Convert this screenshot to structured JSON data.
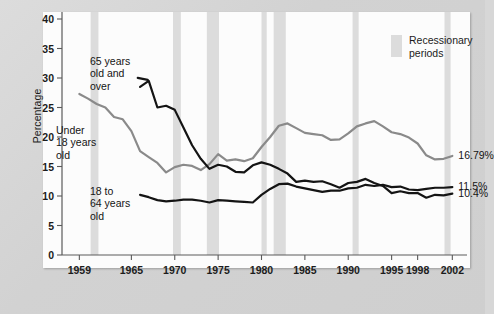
{
  "chart_data": {
    "type": "line",
    "title": "",
    "xlabel": "",
    "ylabel": "Percentage",
    "ylim": [
      0,
      40
    ],
    "xlim": [
      1957,
      2003
    ],
    "yticks": [
      "0",
      "5",
      "10",
      "15",
      "20",
      "25",
      "30",
      "35",
      "40"
    ],
    "ytick_values": [
      0,
      5,
      10,
      15,
      20,
      25,
      30,
      35,
      40
    ],
    "xticks": [
      "1959",
      "1965",
      "1970",
      "1975",
      "1980",
      "1985",
      "1990",
      "1995",
      "1998",
      "2002"
    ],
    "xtick_values": [
      1959,
      1965,
      1970,
      1975,
      1980,
      1985,
      1990,
      1995,
      1998,
      2002
    ],
    "grid": false,
    "legend_position": "top-right",
    "series": [
      {
        "name": "Under 18 years old",
        "color": "#8a8a8a",
        "end_label": "16.79%",
        "x": [
          1959,
          1960,
          1961,
          1962,
          1963,
          1964,
          1965,
          1966,
          1967,
          1968,
          1969,
          1970,
          1971,
          1972,
          1973,
          1974,
          1975,
          1976,
          1977,
          1978,
          1979,
          1980,
          1981,
          1982,
          1983,
          1984,
          1985,
          1986,
          1987,
          1988,
          1989,
          1990,
          1991,
          1992,
          1993,
          1994,
          1995,
          1996,
          1997,
          1998,
          1999,
          2000,
          2001,
          2002
        ],
        "y": [
          27.3,
          26.5,
          25.6,
          25.0,
          23.4,
          23.0,
          21.0,
          17.6,
          16.6,
          15.6,
          14.0,
          14.9,
          15.3,
          15.1,
          14.4,
          15.4,
          17.1,
          16.0,
          16.2,
          15.9,
          16.4,
          18.3,
          20.0,
          21.9,
          22.3,
          21.5,
          20.7,
          20.5,
          20.3,
          19.5,
          19.6,
          20.6,
          21.8,
          22.3,
          22.7,
          21.8,
          20.8,
          20.5,
          19.9,
          18.9,
          16.9,
          16.2,
          16.3,
          16.79
        ]
      },
      {
        "name": "65 years old and over",
        "color": "#141414",
        "end_label": "10.4%",
        "x": [
          1966,
          1967,
          1968,
          1969,
          1970,
          1971,
          1972,
          1973,
          1974,
          1975,
          1976,
          1977,
          1978,
          1979,
          1980,
          1981,
          1982,
          1983,
          1984,
          1985,
          1986,
          1987,
          1988,
          1989,
          1990,
          1991,
          1992,
          1993,
          1994,
          1995,
          1996,
          1997,
          1998,
          1999,
          2000,
          2001,
          2002
        ],
        "y": [
          28.5,
          29.5,
          25.0,
          25.3,
          24.6,
          21.6,
          18.6,
          16.3,
          14.6,
          15.3,
          15.0,
          14.1,
          14.0,
          15.2,
          15.7,
          15.3,
          14.6,
          13.8,
          12.4,
          12.6,
          12.4,
          12.5,
          12.0,
          11.4,
          12.2,
          12.4,
          12.9,
          12.2,
          11.7,
          10.5,
          10.8,
          10.5,
          10.5,
          9.7,
          10.2,
          10.1,
          10.4
        ]
      },
      {
        "name": "18 to 64 years old",
        "color": "#141414",
        "end_label": "11.5%",
        "x": [
          1966,
          1967,
          1968,
          1969,
          1970,
          1971,
          1972,
          1973,
          1974,
          1975,
          1976,
          1977,
          1978,
          1979,
          1980,
          1981,
          1982,
          1983,
          1984,
          1985,
          1986,
          1987,
          1988,
          1989,
          1990,
          1991,
          1992,
          1993,
          1994,
          1995,
          1996,
          1997,
          1998,
          1999,
          2000,
          2001,
          2002
        ],
        "y": [
          10.2,
          9.8,
          9.3,
          9.1,
          9.2,
          9.4,
          9.4,
          9.2,
          8.9,
          9.3,
          9.2,
          9.1,
          9.0,
          8.9,
          10.2,
          11.2,
          12.0,
          12.1,
          11.6,
          11.3,
          11.0,
          10.7,
          10.9,
          10.9,
          11.3,
          11.4,
          11.9,
          11.7,
          11.9,
          11.5,
          11.6,
          11.1,
          11.0,
          11.2,
          11.4,
          11.4,
          11.5
        ]
      }
    ],
    "recession_bands": [
      {
        "start": 1960.3,
        "end": 1961.2
      },
      {
        "start": 1969.8,
        "end": 1970.7
      },
      {
        "start": 1973.7,
        "end": 1975.1
      },
      {
        "start": 1980.0,
        "end": 1980.6
      },
      {
        "start": 1981.4,
        "end": 1982.8
      },
      {
        "start": 1990.5,
        "end": 1991.2
      },
      {
        "start": 2001.1,
        "end": 2001.8
      }
    ],
    "band_color": "#dcdcdc",
    "annotations": [
      {
        "name": "under-18-annotation",
        "text": "Under\n18 years\nold",
        "x_px": 56,
        "y_px": 124
      },
      {
        "name": "over-65-annotation",
        "text": "65 years\nold and\nover",
        "x_px": 90,
        "y_px": 55
      },
      {
        "name": "18-to-64-annotation",
        "text": "18 to\n64 years\nold",
        "x_px": 90,
        "y_px": 185
      }
    ]
  },
  "legend": {
    "label": "Recessionary\nperiods",
    "swatch_color": "#dcdcdc"
  },
  "axis": {
    "y_title": "Percentage"
  }
}
